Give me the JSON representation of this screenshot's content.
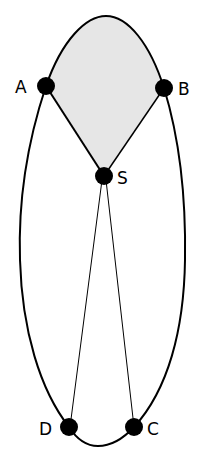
{
  "diagram": {
    "colors": {
      "stroke": "#000000",
      "fill_region": "#e6e6e6",
      "point": "#000000",
      "background": "#ffffff"
    },
    "points": [
      {
        "id": "A",
        "label": "A",
        "x": 46,
        "y": 86
      },
      {
        "id": "B",
        "label": "B",
        "x": 164,
        "y": 88
      },
      {
        "id": "S",
        "label": "S",
        "x": 104,
        "y": 176
      },
      {
        "id": "D",
        "label": "D",
        "x": 69,
        "y": 427
      },
      {
        "id": "C",
        "label": "C",
        "x": 134,
        "y": 427
      }
    ],
    "labels": {
      "A": "A",
      "B": "B",
      "S": "S",
      "C": "C",
      "D": "D"
    },
    "segments": [
      [
        "A",
        "S"
      ],
      [
        "B",
        "S"
      ],
      [
        "S",
        "D"
      ],
      [
        "S",
        "C"
      ]
    ],
    "shaded_region": "A-top-B-S"
  }
}
